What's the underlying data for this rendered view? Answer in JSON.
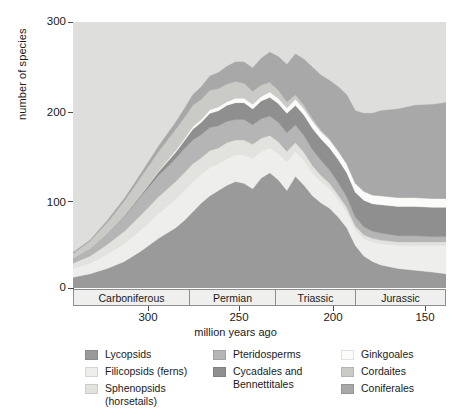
{
  "axes": {
    "ylabel": "number of species",
    "xlabel": "million years ago",
    "yticks": [
      "300",
      "200",
      "100",
      "0"
    ],
    "xticks": [
      "300",
      "250",
      "200",
      "150"
    ]
  },
  "periods": [
    {
      "name": "Carboniferous"
    },
    {
      "name": "Permian"
    },
    {
      "name": "Triassic"
    },
    {
      "name": "Jurassic"
    }
  ],
  "legend": {
    "columns": [
      {
        "items": [
          {
            "label": "Lycopsids",
            "color": "#9a9a9a"
          },
          {
            "label": "Filicopsids (ferns)",
            "color": "#eeeeec"
          },
          {
            "label": "Sphenopsids\n(horsetails)",
            "color": "#e2e2de"
          }
        ]
      },
      {
        "items": [
          {
            "label": "Pteridosperms",
            "color": "#b5b5b5"
          },
          {
            "label": "Cycadales and\nBennettitales",
            "color": "#8f8f8f"
          }
        ]
      },
      {
        "items": [
          {
            "label": "Ginkgoales",
            "color": "#fbfbfa"
          },
          {
            "label": "Cordaites",
            "color": "#cacac6"
          },
          {
            "label": "Coniferales",
            "color": "#a8a8a8"
          }
        ]
      }
    ]
  },
  "chart_data": {
    "type": "area",
    "stacked": true,
    "title": "",
    "xlabel": "million years ago",
    "ylabel": "number of species",
    "xlim": [
      360,
      142
    ],
    "ylim": [
      0,
      300
    ],
    "x_reversed": true,
    "background": "#dededc",
    "gridlines": false,
    "legend_position": "below",
    "x": [
      360,
      350,
      340,
      330,
      320,
      310,
      300,
      295,
      290,
      285,
      280,
      275,
      270,
      265,
      260,
      255,
      250,
      245,
      240,
      235,
      230,
      225,
      220,
      215,
      210,
      205,
      200,
      195,
      190,
      185,
      180,
      170,
      160,
      150,
      142
    ],
    "series": [
      {
        "name": "Lycopsids",
        "color": "#9a9a9a",
        "values": [
          12,
          16,
          22,
          30,
          42,
          56,
          68,
          76,
          86,
          96,
          104,
          110,
          116,
          120,
          118,
          112,
          124,
          130,
          122,
          110,
          126,
          116,
          104,
          96,
          90,
          80,
          68,
          48,
          36,
          30,
          26,
          22,
          20,
          18,
          16
        ]
      },
      {
        "name": "Filicopsids (ferns)",
        "color": "#eeeeec",
        "values": [
          10,
          12,
          16,
          20,
          24,
          28,
          32,
          34,
          34,
          32,
          32,
          30,
          30,
          30,
          32,
          34,
          30,
          28,
          30,
          32,
          28,
          28,
          26,
          24,
          22,
          20,
          18,
          18,
          20,
          22,
          24,
          26,
          28,
          30,
          32
        ]
      },
      {
        "name": "Sphenopsids (horsetails)",
        "color": "#e2e2de",
        "values": [
          6,
          8,
          11,
          14,
          17,
          19,
          20,
          20,
          20,
          19,
          19,
          18,
          18,
          17,
          17,
          16,
          15,
          14,
          13,
          12,
          10,
          9,
          8,
          7,
          6,
          5,
          5,
          4,
          4,
          4,
          4,
          4,
          4,
          4,
          4
        ]
      },
      {
        "name": "Pteridosperms",
        "color": "#b5b5b5",
        "values": [
          6,
          9,
          13,
          17,
          21,
          24,
          26,
          27,
          27,
          26,
          26,
          25,
          24,
          23,
          23,
          22,
          22,
          22,
          22,
          21,
          20,
          19,
          18,
          17,
          15,
          14,
          12,
          10,
          9,
          8,
          8,
          7,
          7,
          6,
          6
        ]
      },
      {
        "name": "Cycadales and Bennettitales",
        "color": "#8f8f8f",
        "values": [
          0,
          0,
          0,
          1,
          2,
          4,
          7,
          9,
          12,
          14,
          16,
          17,
          18,
          19,
          19,
          18,
          20,
          21,
          21,
          22,
          22,
          23,
          24,
          24,
          25,
          26,
          27,
          28,
          30,
          31,
          32,
          33,
          33,
          33,
          33
        ]
      },
      {
        "name": "Ginkgoales",
        "color": "#fbfbfa",
        "values": [
          0,
          0,
          0,
          0,
          0,
          1,
          2,
          2,
          3,
          3,
          4,
          4,
          4,
          5,
          5,
          5,
          5,
          6,
          6,
          6,
          7,
          7,
          8,
          8,
          9,
          9,
          10,
          10,
          10,
          10,
          10,
          10,
          10,
          10,
          10
        ]
      },
      {
        "name": "Cordaites",
        "color": "#cacac6",
        "values": [
          5,
          8,
          12,
          16,
          20,
          22,
          24,
          24,
          24,
          23,
          22,
          21,
          20,
          19,
          17,
          15,
          13,
          11,
          9,
          7,
          5,
          4,
          3,
          2,
          1,
          1,
          0,
          0,
          0,
          0,
          0,
          0,
          0,
          0,
          0
        ]
      },
      {
        "name": "Coniferales",
        "color": "#a8a8a8",
        "values": [
          1,
          1,
          2,
          3,
          4,
          6,
          8,
          10,
          12,
          14,
          16,
          18,
          20,
          22,
          24,
          26,
          30,
          34,
          38,
          42,
          46,
          52,
          58,
          62,
          66,
          72,
          78,
          82,
          88,
          92,
          96,
          100,
          104,
          106,
          108
        ]
      }
    ]
  }
}
